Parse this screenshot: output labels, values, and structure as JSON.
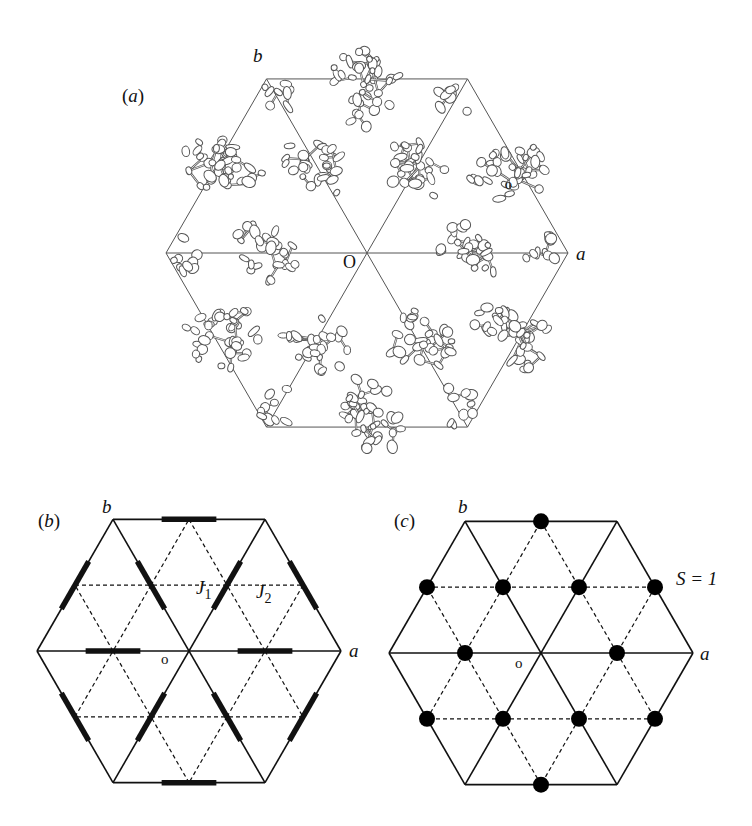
{
  "figure": {
    "panels": [
      {
        "id": "a",
        "label": "(a)",
        "description": "Crystal structure projection showing molecular clusters arranged on a kagome-like lattice",
        "axis_a": "a",
        "axis_b": "b",
        "origin": "O",
        "secondary_origin": "o",
        "center": [
          367,
          253
        ],
        "radius": 201
      },
      {
        "id": "b",
        "label": "(b)",
        "description": "Lattice with two exchange couplings J1 (thick bonds) and J2 (dashed bonds)",
        "axis_a": "a",
        "axis_b": "b",
        "origin": "o",
        "coupling_1": "J",
        "coupling_1_sub": "1",
        "coupling_2": "J",
        "coupling_2_sub": "2",
        "center": [
          189,
          651
        ],
        "radius": 152
      },
      {
        "id": "c",
        "label": "(c)",
        "description": "Kagome lattice of S = 1 spins (black dots) at bond midpoints",
        "axis_a": "a",
        "axis_b": "b",
        "origin": "o",
        "spin_label": "S = 1",
        "center": [
          541,
          653
        ],
        "radius": 152
      }
    ],
    "colors": {
      "line": "#111111",
      "molecule_stroke": "#555555",
      "dot": "#000000",
      "background": "#ffffff"
    }
  }
}
